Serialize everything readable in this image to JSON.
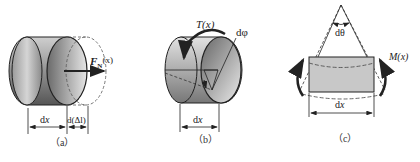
{
  "figure": {
    "panels": [
      {
        "id": "a",
        "caption": "（a）",
        "force_label": "F",
        "force_sub": "N",
        "force_arg": "(x)",
        "dim_left": "dx",
        "dim_right": "d(Δl)"
      },
      {
        "id": "b",
        "caption": "（b）",
        "torque_label": "T(x)",
        "angle_label": "dφ",
        "dim": "dx"
      },
      {
        "id": "c",
        "caption": "（c）",
        "angle_label": "dθ",
        "moment_label": "M(x)",
        "dim": "dx"
      }
    ],
    "colors": {
      "line": "#222222",
      "shade_dark": "#7a7a7a",
      "shade_light": "#d8d8d8",
      "rect_fill": "#c8c8c8"
    }
  }
}
